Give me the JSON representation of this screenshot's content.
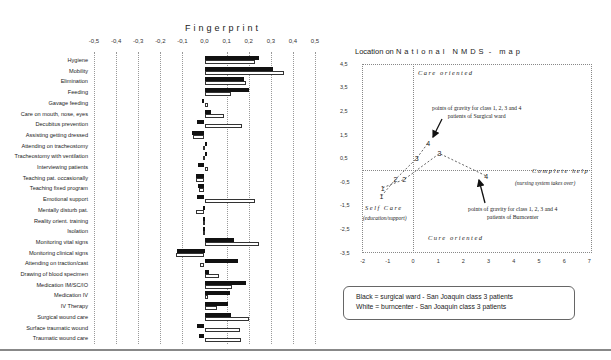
{
  "fingerprint": {
    "title": "Fingerprint",
    "axis_ticks": [
      "-0,5",
      "-0,4",
      "-0,3",
      "-0,2",
      "-0,1",
      "0,0",
      "0,1",
      "0,2",
      "0,3",
      "0,4",
      "0,5"
    ],
    "rows": [
      {
        "label": "Hygiene",
        "black": 0.245,
        "white": 0.23
      },
      {
        "label": "Mobility",
        "black": 0.31,
        "white": 0.36
      },
      {
        "label": "Elimination",
        "black": 0.18,
        "white": 0.19
      },
      {
        "label": "Feeding",
        "black": 0.2,
        "white": 0.12
      },
      {
        "label": "Gavage feeding",
        "black": -0.01,
        "white": 0.015
      },
      {
        "label": "Care on mouth, nose, eyes",
        "black": 0.03,
        "white": 0.09
      },
      {
        "label": "Decubitus prevention",
        "black": -0.035,
        "white": 0.17
      },
      {
        "label": "Assisting getting dressed",
        "black": -0.055,
        "white": -0.05
      },
      {
        "label": "Attending on tracheostomy",
        "black": 0.0,
        "white": -0.002
      },
      {
        "label": "Tracheostomy with ventilation",
        "black": 0.0,
        "white": -0.002
      },
      {
        "label": "Interviewing patients",
        "black": -0.03,
        "white": 0.015
      },
      {
        "label": "Teaching pat. occasionally",
        "black": -0.04,
        "white": -0.04
      },
      {
        "label": "Teaching fixed program",
        "black": -0.03,
        "white": -0.025
      },
      {
        "label": "Emotional support",
        "black": -0.035,
        "white": 0.23
      },
      {
        "label": "Mentally disturb pat.",
        "black": -0.008,
        "white": -0.04
      },
      {
        "label": "Reality orient. training",
        "black": -0.006,
        "white": -0.004
      },
      {
        "label": "Isolation",
        "black": -0.006,
        "white": -0.004
      },
      {
        "label": "Monitoring vital signs",
        "black": 0.135,
        "white": 0.245
      },
      {
        "label": "Monitoring clinical signs",
        "black": -0.125,
        "white": -0.13
      },
      {
        "label": "Attending on traction/cast",
        "black": 0.15,
        "white": -0.02
      },
      {
        "label": "Drawing of blood specimen",
        "black": 0.02,
        "white": 0.065
      },
      {
        "label": "Medication IM/SC/IO",
        "black": 0.19,
        "white": 0.125
      },
      {
        "label": "Medication IV",
        "black": 0.115,
        "white": 0.015
      },
      {
        "label": "IV Therapy",
        "black": 0.105,
        "white": 0.055
      },
      {
        "label": "Surgical wound care",
        "black": 0.12,
        "white": 0.2
      },
      {
        "label": "Surface traumatic wound",
        "black": -0.035,
        "white": 0.16
      },
      {
        "label": "Traumatic wound care",
        "black": -0.025,
        "white": 0.165
      }
    ]
  },
  "map": {
    "title_a": "Location on",
    "title_b": "National NMDS",
    "title_c": "- map",
    "y_ticks": [
      "4,5",
      "3,5",
      "2,5",
      "1,5",
      "0,5",
      "-0,5",
      "-1,5",
      "-2,5",
      "-3,5"
    ],
    "x_ticks": [
      "-2",
      "-1",
      "0",
      "1",
      "2",
      "3",
      "4",
      "5",
      "6",
      "7"
    ],
    "quadrants": {
      "care_oriented": "Care oriented",
      "complete_help": "Complete help",
      "complete_help_sub": "(nursing system takes over)",
      "self_care": "Self Care",
      "self_care_sub": "(education/support)",
      "cure_oriented": "Cure oriented"
    },
    "annotation_surgical": [
      "points of gravity for class 1, 2, 3 and 4",
      "patients of Surgical ward"
    ],
    "annotation_burn": [
      "points of gravity for class 1, 2, 3 and 4",
      "patients of Burncenter"
    ]
  },
  "legend": {
    "line1": "Black = surgical ward - San Joaquin class 3 patients",
    "line2": "White = burncenter - San Joaquin class 3 patients"
  },
  "chart_data": [
    {
      "type": "bar",
      "orientation": "horizontal",
      "title": "Fingerprint",
      "xlim": [
        -0.5,
        0.5
      ],
      "x_ticks": [
        -0.5,
        -0.4,
        -0.3,
        -0.2,
        -0.1,
        0.0,
        0.1,
        0.2,
        0.3,
        0.4,
        0.5
      ],
      "grid": "vertical dotted",
      "categories": [
        "Hygiene",
        "Mobility",
        "Elimination",
        "Feeding",
        "Gavage feeding",
        "Care on mouth, nose, eyes",
        "Decubitus prevention",
        "Assisting getting dressed",
        "Attending on tracheostomy",
        "Tracheostomy with ventilation",
        "Interviewing patients",
        "Teaching pat. occasionally",
        "Teaching fixed program",
        "Emotional support",
        "Mentally disturb pat.",
        "Reality orient. training",
        "Isolation",
        "Monitoring vital signs",
        "Monitoring clinical signs",
        "Attending on traction/cast",
        "Drawing of blood specimen",
        "Medication IM/SC/IO",
        "Medication IV",
        "IV Therapy",
        "Surgical wound care",
        "Surface traumatic wound",
        "Traumatic wound care"
      ],
      "series": [
        {
          "name": "Black = surgical ward - San Joaquin class 3 patients",
          "values": [
            0.245,
            0.31,
            0.18,
            0.2,
            -0.01,
            0.03,
            -0.035,
            -0.055,
            0.0,
            0.0,
            -0.03,
            -0.04,
            -0.03,
            -0.035,
            -0.008,
            -0.006,
            -0.006,
            0.135,
            -0.125,
            0.15,
            0.02,
            0.19,
            0.115,
            0.105,
            0.12,
            -0.035,
            -0.025
          ]
        },
        {
          "name": "White = burncenter - San Joaquin class 3 patients",
          "values": [
            0.23,
            0.36,
            0.19,
            0.12,
            0.015,
            0.09,
            0.17,
            -0.05,
            -0.002,
            -0.002,
            0.015,
            -0.04,
            -0.025,
            0.23,
            -0.04,
            -0.004,
            -0.004,
            0.245,
            -0.13,
            -0.02,
            0.065,
            0.125,
            0.015,
            0.055,
            0.2,
            0.16,
            0.165
          ]
        }
      ],
      "legend_position": "bottom-right box"
    },
    {
      "type": "line",
      "title": "Location on National NMDS - map",
      "xlim": [
        -2,
        7
      ],
      "ylim": [
        -3.5,
        4.5
      ],
      "x_ticks": [
        -2,
        -1,
        0,
        1,
        2,
        3,
        4,
        5,
        6,
        7
      ],
      "y_ticks": [
        4.5,
        3.5,
        2.5,
        1.5,
        0.5,
        -0.5,
        -1.5,
        -2.5,
        -3.5
      ],
      "grid": "dotted frame with x=0 and y=0 reference lines",
      "series": [
        {
          "name": "Surgical ward (class 1-4 points of gravity)",
          "labels": [
            "1",
            "2",
            "3",
            "4"
          ],
          "x": [
            -1.25,
            -0.7,
            0.15,
            0.6
          ],
          "y": [
            -1.1,
            -0.4,
            0.5,
            1.15
          ]
        },
        {
          "name": "Burncenter (class 1-4 points of gravity)",
          "labels": [
            "1",
            "2",
            "3",
            "4"
          ],
          "x": [
            -1.2,
            -0.35,
            1.05,
            2.9
          ],
          "y": [
            -0.75,
            -0.4,
            0.7,
            -0.25
          ]
        }
      ],
      "annotations": [
        "Care oriented",
        "Complete help (nursing system takes over)",
        "Self Care (education/support)",
        "Cure oriented",
        "points of gravity for class 1, 2, 3 and 4 patients of Surgical ward",
        "points of gravity for class 1, 2, 3 and 4 patients of Burncenter"
      ]
    }
  ]
}
